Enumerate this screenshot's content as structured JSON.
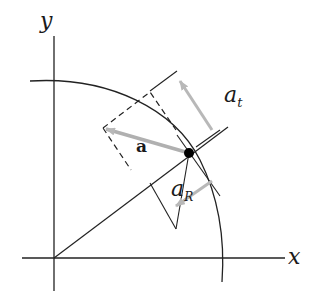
{
  "diagram": {
    "title": "",
    "labels": {
      "y_axis": "y",
      "x_axis": "x",
      "acceleration": "a",
      "tangential_main": "a",
      "tangential_sub": "t",
      "radial_main": "a",
      "radial_sub": "R"
    },
    "colors": {
      "line": "#222222",
      "vector": "#b8b8b8",
      "point": "#000000",
      "background": "#ffffff"
    },
    "elements": [
      "x-axis",
      "y-axis",
      "circular-path-arc",
      "radial-line",
      "particle-point",
      "acceleration-vector-a",
      "tangential-component-a_t",
      "radial-component-a_R",
      "dashed-parallelogram",
      "tangent-line"
    ]
  }
}
